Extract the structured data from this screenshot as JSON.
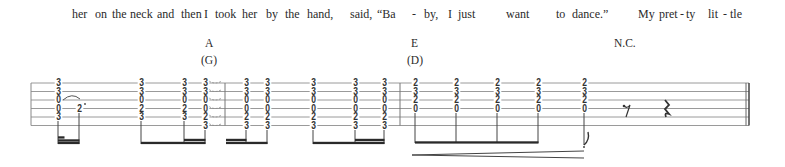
{
  "lyrics": [
    {
      "text": "her",
      "x": 72
    },
    {
      "text": "on",
      "x": 95
    },
    {
      "text": "the",
      "x": 112
    },
    {
      "text": "neck",
      "x": 130
    },
    {
      "text": "and",
      "x": 157
    },
    {
      "text": "then",
      "x": 181
    },
    {
      "text": "I",
      "x": 204
    },
    {
      "text": "took",
      "x": 215
    },
    {
      "text": "her",
      "x": 242
    },
    {
      "text": "by",
      "x": 266
    },
    {
      "text": "the",
      "x": 285
    },
    {
      "text": "hand,",
      "x": 307
    },
    {
      "text": "said,",
      "x": 350
    },
    {
      "text": "“Ba",
      "x": 377
    },
    {
      "text": "-",
      "x": 412
    },
    {
      "text": "by,",
      "x": 424
    },
    {
      "text": "I",
      "x": 448
    },
    {
      "text": "just",
      "x": 458
    },
    {
      "text": "want",
      "x": 506
    },
    {
      "text": "to",
      "x": 556
    },
    {
      "text": "dance.”",
      "x": 572
    },
    {
      "text": "My",
      "x": 638
    },
    {
      "text": "pret",
      "x": 659
    },
    {
      "text": "-",
      "x": 680
    },
    {
      "text": "ty",
      "x": 686
    },
    {
      "text": "lit",
      "x": 708
    },
    {
      "text": "-",
      "x": 723
    },
    {
      "text": "tle",
      "x": 730
    }
  ],
  "chords": [
    {
      "name": "A",
      "capo_name": "(G)",
      "x": 205
    },
    {
      "name": "E",
      "capo_name": "(D)",
      "x": 411
    },
    {
      "name": "N.C.",
      "capo_name": "",
      "x": 614
    }
  ],
  "staff": {
    "left": 31,
    "right": 749,
    "line_y": [
      83,
      91.5,
      100,
      108.5,
      117,
      125.5
    ],
    "barlines": [
      225,
      400
    ],
    "final_barline": 749
  },
  "tab_columns": [
    {
      "x": 58,
      "frets": [
        "3",
        "3",
        "0",
        "0",
        "3",
        ""
      ]
    },
    {
      "x": 79,
      "frets": [
        "",
        "",
        "",
        "2",
        "",
        ""
      ]
    },
    {
      "x": 141,
      "frets": [
        "3",
        "3",
        "0",
        "2",
        "3",
        ""
      ]
    },
    {
      "x": 184,
      "frets": [
        "3",
        "3",
        "0",
        "2",
        "3",
        ""
      ]
    },
    {
      "x": 205,
      "frets": [
        "3",
        "3",
        "0",
        "0",
        "2",
        "3"
      ]
    },
    {
      "x": 246,
      "frets": [
        "3",
        "3",
        "0",
        "0",
        "2",
        "3"
      ]
    },
    {
      "x": 267,
      "frets": [
        "3",
        "3",
        "0",
        "0",
        "2",
        "3"
      ]
    },
    {
      "x": 313,
      "frets": [
        "3",
        "3",
        "0",
        "0",
        "2",
        "3"
      ]
    },
    {
      "x": 355,
      "frets": [
        "3",
        "3",
        "0",
        "0",
        "2",
        "3"
      ]
    },
    {
      "x": 384,
      "frets": [
        "3",
        "3",
        "0",
        "0",
        "2",
        "3"
      ]
    },
    {
      "x": 415,
      "frets": [
        "2",
        "3",
        "2",
        "0",
        "",
        ""
      ]
    },
    {
      "x": 456,
      "frets": [
        "2",
        "3",
        "2",
        "0",
        "",
        ""
      ]
    },
    {
      "x": 497,
      "frets": [
        "2",
        "3",
        "2",
        "0",
        "",
        ""
      ]
    },
    {
      "x": 538,
      "frets": [
        "2",
        "3",
        "2",
        "0",
        "",
        ""
      ]
    },
    {
      "x": 584,
      "frets": [
        "2",
        "3",
        "2",
        "0",
        "",
        ""
      ]
    }
  ],
  "rests": [
    {
      "type": "eighth-rest",
      "x": 626
    },
    {
      "type": "quarter-rest",
      "x": 664
    }
  ],
  "dynamics": {
    "type": "crescendo",
    "x1": 412,
    "x2": 584
  }
}
